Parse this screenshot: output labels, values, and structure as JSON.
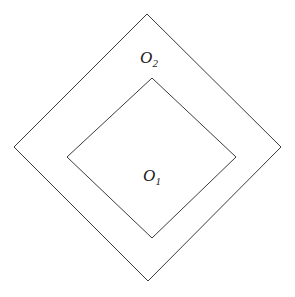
{
  "figure": {
    "background_color": "#ffffff",
    "width": 295,
    "height": 297
  },
  "style": {
    "stroke_color": "#3b3b3b",
    "stroke_width": 1,
    "fill": "none",
    "label_color": "#1a1a1a"
  },
  "shapes": [
    {
      "id": "outer-diamond",
      "name": "O2",
      "label_base": "O",
      "label_subscript": "2",
      "points": "147,14 281,147 148,281 14,147",
      "vertices": {
        "top": [
          147,
          14
        ],
        "right": [
          281,
          147
        ],
        "bottom": [
          148,
          281
        ],
        "left": [
          14,
          147
        ]
      },
      "label_position": [
        149,
        63
      ]
    },
    {
      "id": "inner-diamond",
      "name": "O1",
      "label_base": "O",
      "label_subscript": "1",
      "points": "152,78 236,157 152,238 67,157",
      "vertices": {
        "top": [
          152,
          78
        ],
        "right": [
          236,
          157
        ],
        "bottom": [
          152,
          238
        ],
        "left": [
          67,
          157
        ]
      },
      "label_position": [
        152,
        181
      ]
    }
  ],
  "labels": {
    "outer": {
      "base": "O",
      "subscript": "2"
    },
    "inner": {
      "base": "O",
      "subscript": "1"
    }
  }
}
